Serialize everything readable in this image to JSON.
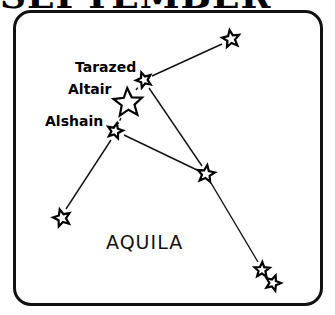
{
  "header": {
    "title": "SEPTEMBER"
  },
  "constellation": {
    "name": "AQUILA",
    "labels": {
      "tarazed": "Tarazed",
      "altair": "Altair",
      "alshain": "Alshain"
    }
  },
  "stars": [
    {
      "id": "tarazed",
      "x": 144,
      "y": 80,
      "r": 8
    },
    {
      "id": "altair",
      "x": 128,
      "y": 103,
      "r": 15
    },
    {
      "id": "alshain",
      "x": 115,
      "y": 131,
      "r": 8
    },
    {
      "id": "upper-right",
      "x": 231,
      "y": 39,
      "r": 9
    },
    {
      "id": "center-right",
      "x": 206,
      "y": 174,
      "r": 9
    },
    {
      "id": "lower-left",
      "x": 62,
      "y": 218,
      "r": 9
    },
    {
      "id": "lower-right-a",
      "x": 262,
      "y": 270,
      "r": 8
    },
    {
      "id": "lower-right-b",
      "x": 273,
      "y": 283,
      "r": 8
    }
  ],
  "colors": {
    "ink": "#000000",
    "background": "#ffffff"
  }
}
